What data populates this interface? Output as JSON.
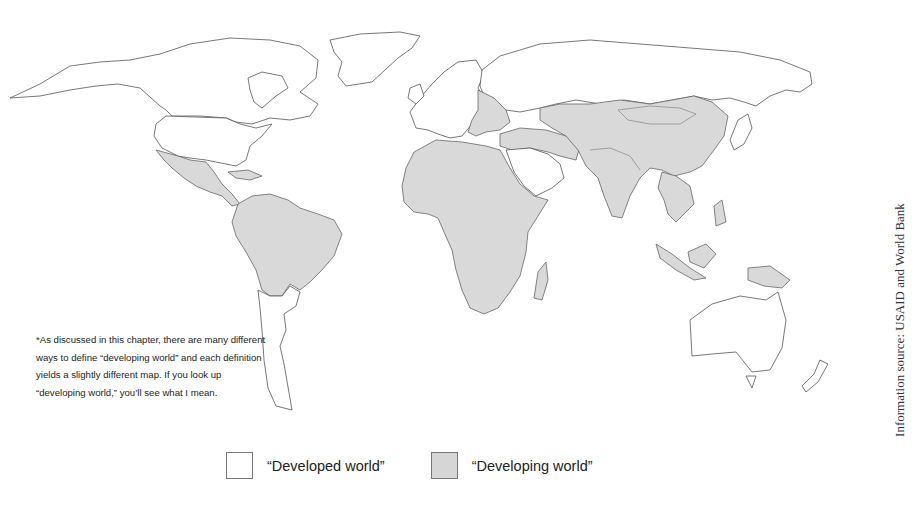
{
  "map": {
    "title": "World map: developed vs. developing world",
    "projection": "Robinson-style world map",
    "colors": {
      "developed": "#ffffff",
      "developing": "#d9d9d9",
      "border": "#666666"
    },
    "regions": [
      {
        "name": "North America (USA, Canada, Greenland)",
        "category": "developed"
      },
      {
        "name": "Mexico, Central America & Caribbean",
        "category": "developing"
      },
      {
        "name": "South America (excl. Chile, Argentina, Uruguay)",
        "category": "developing"
      },
      {
        "name": "Chile, Argentina, Uruguay",
        "category": "developed"
      },
      {
        "name": "Western & Northern Europe",
        "category": "developed"
      },
      {
        "name": "Eastern Europe, Ukraine, Balkans",
        "category": "developing"
      },
      {
        "name": "Russia",
        "category": "developed"
      },
      {
        "name": "Africa",
        "category": "developing"
      },
      {
        "name": "Middle East (excl. Saudi Arabia, Gulf states, Israel)",
        "category": "developing"
      },
      {
        "name": "Saudi Arabia & Gulf states",
        "category": "developed"
      },
      {
        "name": "Central Asia, South Asia, China, Mongolia",
        "category": "developing"
      },
      {
        "name": "Southeast Asia & Indonesia, Papua New Guinea",
        "category": "developing"
      },
      {
        "name": "Japan, South Korea",
        "category": "developed"
      },
      {
        "name": "Australia, New Zealand",
        "category": "developed"
      }
    ]
  },
  "footnote": "*As discussed in this chapter, there are many different ways to define “developing world” and each definition yields a slightly different map. If you look up “developing world,” you’ll see what I mean.",
  "legend": {
    "items": [
      {
        "label": "“Developed world”",
        "color": "#ffffff"
      },
      {
        "label": "“Developing world”",
        "color": "#d6d6d6"
      }
    ]
  },
  "source": "Information source: USAID and World Bank"
}
